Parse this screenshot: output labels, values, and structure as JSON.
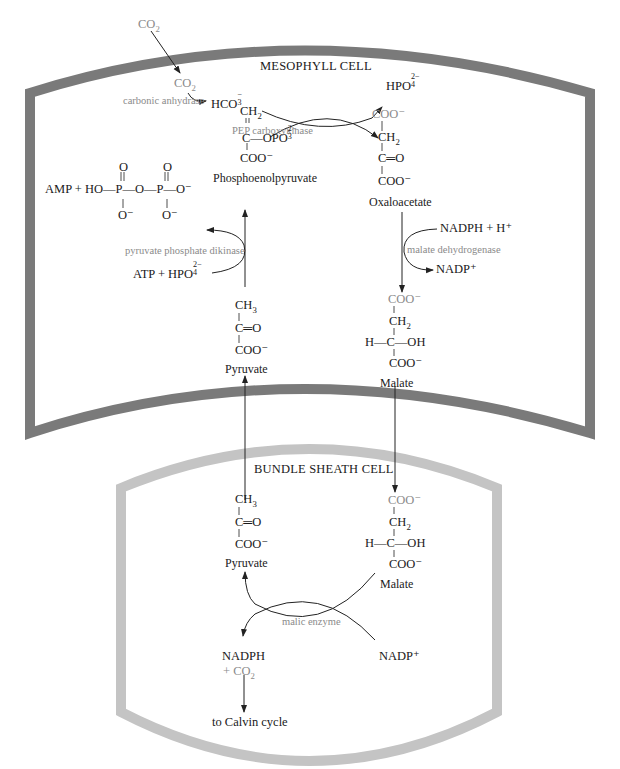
{
  "cells": {
    "mesophyll": {
      "label": "MESOPHYLL CELL",
      "border_color": "#7a7a7a"
    },
    "bundle_sheath": {
      "label": "BUNDLE SHEATH CELL",
      "border_color": "#c4c4c4"
    }
  },
  "mesophyll": {
    "co2_outside": "CO",
    "co2_inside": "CO",
    "carbonic_anhydrase": "carbonic anhydrase",
    "hco3": "HCO",
    "hpo4": "HPO",
    "pep_carboxykinase": "PEP carboxykinase",
    "pep": {
      "ch2": "CH",
      "c_opo3": "C—OPO",
      "coo": "COO⁻",
      "name": "Phosphoenolpyruvate"
    },
    "oxaloacetate": {
      "coo_top": "COO⁻",
      "ch2": "CH",
      "c_o": "C═O",
      "coo": "COO⁻",
      "name": "Oxaloacetate"
    },
    "pyrophosphate": {
      "lhs": "AMP + HO—P—O—P—O⁻",
      "o_top_1": "O",
      "o_top_2": "O",
      "o_bot_1": "O⁻",
      "o_bot_2": "O⁻"
    },
    "pyruvate_phosphate_dikinase": "pyruvate  phosphate  dikinase",
    "atp_hpo4": "ATP +  HPO",
    "nadph_h": "NADPH + H⁺",
    "malate_dehydrogenase": "malate dehydrogenase",
    "nadp": "NADP⁺",
    "pyruvate": {
      "ch3": "CH",
      "c_o": "C═O",
      "coo": "COO⁻",
      "name": "Pyruvate"
    },
    "malate": {
      "coo_top": "COO⁻",
      "ch2": "CH",
      "hcoh": "H—C—OH",
      "coo": "COO⁻",
      "name": "Malate"
    }
  },
  "bundle_sheath": {
    "pyruvate": {
      "ch3": "CH",
      "c_o": "C═O",
      "coo": "COO⁻",
      "name": "Pyruvate"
    },
    "malate": {
      "coo_top": "COO⁻",
      "ch2": "CH",
      "hcoh": "H—C—OH",
      "coo": "COO⁻",
      "name": "Malate"
    },
    "malic_enzyme": "malic enzyme",
    "nadph": "NADPH",
    "plus_co2": "+ CO",
    "nadp": "NADP⁺",
    "to_calvin": "to Calvin cycle"
  },
  "subscripts": {
    "two": "2",
    "three": "3",
    "four": "4"
  },
  "superscripts": {
    "two_minus": "2−",
    "minus": "−"
  },
  "colors": {
    "text": "#1a1a1a",
    "gray_text": "#8a8a8a",
    "arrow": "#222222"
  }
}
